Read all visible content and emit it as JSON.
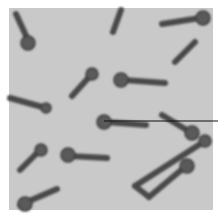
{
  "image": {
    "subject": "micrograph of rod-shaped bacteria with terminal spores (drumstick morphology)",
    "background_color": "#c9c9c9",
    "cell_color": "#4a4a4a",
    "spore_color": "#5a5a5a",
    "pointer_line_color": "#111111"
  },
  "cells": [
    {
      "x1": 16,
      "y1": 14,
      "x2": 28,
      "y2": 40,
      "spore": [
        28,
        43,
        7
      ]
    },
    {
      "x1": 72,
      "y1": 96,
      "x2": 90,
      "y2": 76,
      "spore": [
        92,
        74,
        6
      ]
    },
    {
      "x1": 10,
      "y1": 98,
      "x2": 46,
      "y2": 108,
      "spore": [
        46,
        108,
        5
      ]
    },
    {
      "x1": 113,
      "y1": 32,
      "x2": 121,
      "y2": 10,
      "spore": null
    },
    {
      "x1": 162,
      "y1": 24,
      "x2": 200,
      "y2": 18,
      "spore": [
        203,
        18,
        7
      ]
    },
    {
      "x1": 175,
      "y1": 62,
      "x2": 195,
      "y2": 42,
      "spore": null
    },
    {
      "x1": 165,
      "y1": 83,
      "x2": 124,
      "y2": 80,
      "spore": [
        121,
        80,
        7
      ]
    },
    {
      "x1": 146,
      "y1": 125,
      "x2": 106,
      "y2": 122,
      "spore": [
        104,
        122,
        7
      ]
    },
    {
      "x1": 162,
      "y1": 115,
      "x2": 190,
      "y2": 132,
      "spore": [
        192,
        133,
        7
      ]
    },
    {
      "x1": 20,
      "y1": 170,
      "x2": 40,
      "y2": 150,
      "spore": [
        41,
        150,
        6
      ]
    },
    {
      "x1": 107,
      "y1": 158,
      "x2": 70,
      "y2": 156,
      "spore": [
        68,
        155,
        7
      ]
    },
    {
      "x1": 20,
      "y1": 205,
      "x2": 57,
      "y2": 189,
      "spore": [
        25,
        204,
        7
      ]
    },
    {
      "x1": 135,
      "y1": 186,
      "x2": 205,
      "y2": 141,
      "spore": [
        205,
        141,
        6
      ]
    },
    {
      "x1": 135,
      "y1": 186,
      "x2": 149,
      "y2": 197,
      "spore": null
    },
    {
      "x1": 149,
      "y1": 197,
      "x2": 186,
      "y2": 166,
      "spore": [
        187,
        166,
        7
      ]
    }
  ],
  "pointer_line": {
    "x1": 104,
    "y1": 121,
    "x2": 218,
    "y2": 121
  }
}
